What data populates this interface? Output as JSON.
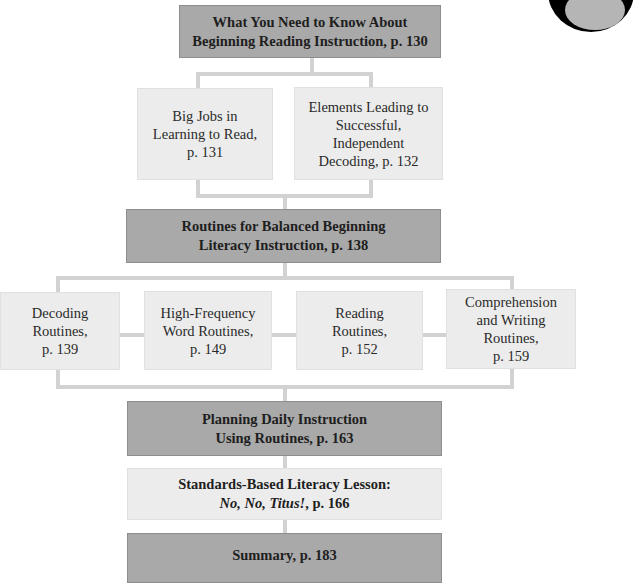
{
  "diagram": {
    "type": "chapter-flowchart",
    "nodes": {
      "overview": {
        "lines": [
          "What You Need to Know About",
          "Beginning Reading Instruction, p. 130"
        ],
        "style": "dark"
      },
      "big_jobs": {
        "lines": [
          "Big Jobs in",
          "Learning to Read,",
          "p. 131"
        ],
        "style": "light"
      },
      "elements": {
        "lines": [
          "Elements Leading to",
          "Successful,",
          "Independent",
          "Decoding, p. 132"
        ],
        "style": "light"
      },
      "routines": {
        "lines": [
          "Routines for Balanced Beginning",
          "Literacy Instruction, p. 138"
        ],
        "style": "dark"
      },
      "decoding": {
        "lines": [
          "Decoding",
          "Routines,",
          "p. 139"
        ],
        "style": "light"
      },
      "high_frequency": {
        "lines": [
          "High-Frequency",
          "Word Routines,",
          "p. 149"
        ],
        "style": "light"
      },
      "reading": {
        "lines": [
          "Reading",
          "Routines,",
          "p. 152"
        ],
        "style": "light"
      },
      "comprehension": {
        "lines": [
          "Comprehension",
          "and Writing",
          "Routines,",
          "p. 159"
        ],
        "style": "light"
      },
      "planning": {
        "lines": [
          "Planning Daily Instruction",
          "Using Routines, p. 163"
        ],
        "style": "dark"
      },
      "standards": {
        "line1": "Standards-Based Literacy Lesson:",
        "line2_italic": "No, No, Titus!",
        "line2_rest": ", p. 166",
        "style": "light-bold"
      },
      "summary": {
        "lines": [
          "Summary, p. 183"
        ],
        "style": "dark"
      }
    },
    "edges": [
      [
        "overview",
        "big_jobs"
      ],
      [
        "overview",
        "elements"
      ],
      [
        "big_jobs",
        "routines"
      ],
      [
        "elements",
        "routines"
      ],
      [
        "routines",
        "decoding"
      ],
      [
        "routines",
        "high_frequency"
      ],
      [
        "routines",
        "reading"
      ],
      [
        "routines",
        "comprehension"
      ],
      [
        "decoding",
        "planning"
      ],
      [
        "high_frequency",
        "planning"
      ],
      [
        "reading",
        "planning"
      ],
      [
        "comprehension",
        "planning"
      ],
      [
        "planning",
        "standards"
      ],
      [
        "standards",
        "summary"
      ]
    ],
    "colors": {
      "dark_box": "#a9a9a9",
      "light_box": "#ececec",
      "connector": "#d2d2d2",
      "text": "#222222"
    }
  }
}
